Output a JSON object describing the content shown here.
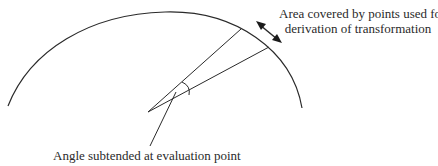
{
  "diagram": {
    "labels": {
      "area_line1": "Area covered by points used for",
      "area_line2": "derivation of transformation",
      "angle": "Angle subtended at evaluation point"
    },
    "colors": {
      "stroke": "#2a2a2a",
      "background": "#ffffff"
    }
  }
}
